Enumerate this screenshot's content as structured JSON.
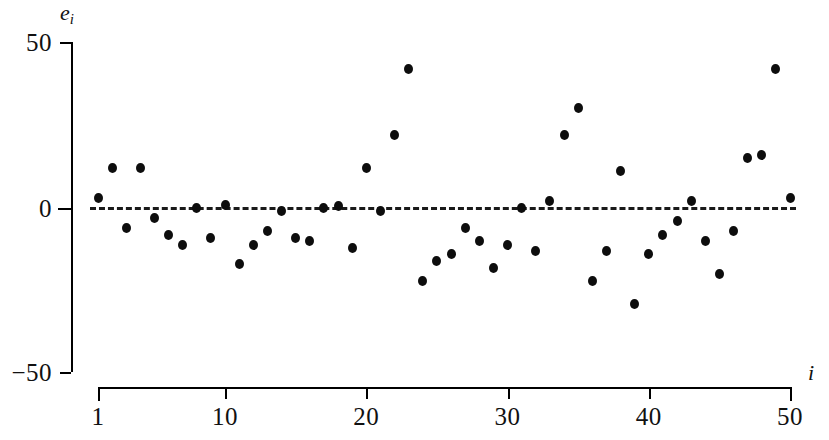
{
  "chart_data": {
    "type": "scatter",
    "title": "",
    "xlabel": "i",
    "ylabel": "e_i",
    "ylim": [
      -50,
      50
    ],
    "xlim": [
      1,
      50
    ],
    "grid": false,
    "legend": null,
    "reference_line": {
      "y": 0,
      "style": "dashed"
    },
    "x": [
      1,
      2,
      3,
      4,
      5,
      6,
      7,
      8,
      9,
      10,
      11,
      12,
      13,
      14,
      15,
      16,
      17,
      18,
      19,
      20,
      21,
      22,
      23,
      24,
      25,
      26,
      27,
      28,
      29,
      30,
      31,
      32,
      33,
      34,
      35,
      36,
      37,
      38,
      39,
      40,
      41,
      42,
      43,
      44,
      45,
      46,
      47,
      48,
      49,
      50
    ],
    "values": [
      3,
      12,
      -6,
      12,
      -3,
      -8,
      -11,
      0,
      -9,
      1,
      -17,
      -11,
      -7,
      -1,
      -9,
      -10,
      0,
      0.5,
      -12,
      12,
      -1,
      22,
      42,
      -22,
      -16,
      -14,
      -6,
      -10,
      -18,
      -11,
      0,
      -13,
      2,
      22,
      30,
      -22,
      -13,
      11,
      -29,
      -14,
      -8,
      -4,
      2,
      -10,
      -20,
      -7,
      15,
      16,
      42,
      3
    ],
    "y_tick_labels": [
      "50",
      "0",
      "−50"
    ],
    "y_tick_values": [
      50,
      0,
      -50
    ],
    "x_tick_labels": [
      "1",
      "10",
      "20",
      "30",
      "40",
      "50"
    ],
    "x_tick_values": [
      1,
      10,
      20,
      30,
      40,
      50
    ],
    "marker": "filled-circle",
    "marker_color": "#0d0d0d"
  },
  "axes": {
    "y_title": "e",
    "y_title_sub": "i",
    "x_title": "i"
  }
}
